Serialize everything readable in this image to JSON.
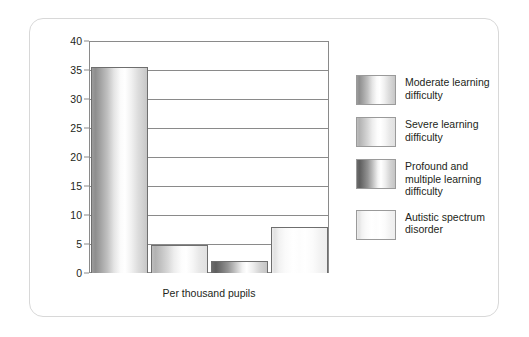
{
  "chart_data": {
    "type": "bar",
    "title": "",
    "subtitle": "",
    "xlabel": "Per thousand pupils",
    "ylabel": "",
    "ylim": [
      0,
      40
    ],
    "ytick_step": 5,
    "yticks": [
      "40",
      "35",
      "30",
      "25",
      "20",
      "15",
      "10",
      "5",
      "0"
    ],
    "grid": true,
    "legend_position": "right",
    "categories": [
      "Moderate learning difficulty",
      "Severe learning difficulty",
      "Profound and multiple learning difficulty",
      "Autistic spectrum disorder"
    ],
    "values": [
      35.5,
      4.9,
      2.0,
      8.0
    ],
    "series": [
      {
        "name": "Per thousand pupils",
        "values": [
          35.5,
          4.9,
          2.0,
          8.0
        ]
      }
    ]
  },
  "axis": {
    "y_max_label": "40",
    "ticks": [
      {
        "label": "40",
        "value": 40
      },
      {
        "label": "35",
        "value": 35
      },
      {
        "label": "30",
        "value": 30
      },
      {
        "label": "25",
        "value": 25
      },
      {
        "label": "20",
        "value": 20
      },
      {
        "label": "15",
        "value": 15
      },
      {
        "label": "10",
        "value": 10
      },
      {
        "label": "5",
        "value": 5
      },
      {
        "label": "0",
        "value": 0
      }
    ],
    "caption": "Per thousand pupils"
  },
  "legend": {
    "items": [
      {
        "label": "Moderate learning\ndifficulty",
        "swatch": "fill-moderate",
        "color": "#9c9c9c"
      },
      {
        "label": "Severe learning\ndifficulty",
        "swatch": "fill-severe",
        "color": "#bdbdbd"
      },
      {
        "label": "Profound and\nmultiple learning\ndifficulty",
        "swatch": "fill-profound",
        "color": "#6b6b6b"
      },
      {
        "label": "Autistic spectrum\ndisorder",
        "swatch": "fill-autistic",
        "color": "#ececec"
      }
    ]
  },
  "style": {
    "card_border": "#d8d8d8",
    "axis_line": "#8a8a8a",
    "bar_outline": "#6e6e6e",
    "text": "#231f20",
    "background": "#ffffff"
  }
}
